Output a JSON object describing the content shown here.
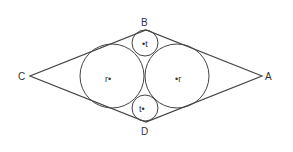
{
  "diagram": {
    "vertices": {
      "A": {
        "label": "A",
        "x": 262,
        "y": 76
      },
      "B": {
        "label": "B",
        "x": 146,
        "y": 30
      },
      "C": {
        "label": "C",
        "x": 30,
        "y": 76
      },
      "D": {
        "label": "D",
        "x": 146,
        "y": 122
      }
    },
    "circles": {
      "left_big": {
        "cx": 112,
        "cy": 76,
        "r": 32,
        "label": "r•"
      },
      "right_big": {
        "cx": 177,
        "cy": 76,
        "r": 32,
        "label": "•r"
      },
      "top_small": {
        "cx": 145,
        "cy": 43,
        "r": 13,
        "label": "•t"
      },
      "bottom_small": {
        "cx": 145,
        "cy": 108,
        "r": 13,
        "label": "t•"
      }
    },
    "stroke_color": "#444444"
  }
}
